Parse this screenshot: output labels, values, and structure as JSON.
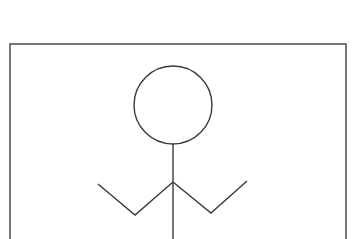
{
  "figure": {
    "colors": {
      "stroke": "#3a3a3a",
      "frame": "#555555",
      "background": "#ffffff"
    },
    "frame": {
      "x": 10,
      "y": 44,
      "width": 336,
      "height": 200
    },
    "head": {
      "cx": 173,
      "cy": 105,
      "r": 39
    },
    "body": {
      "x": 173,
      "y1": 144,
      "y2": 239
    },
    "left_arm": {
      "points": "173,182 135,215 98,184"
    },
    "right_arm": {
      "points": "173,182 211,213 247,181"
    }
  }
}
